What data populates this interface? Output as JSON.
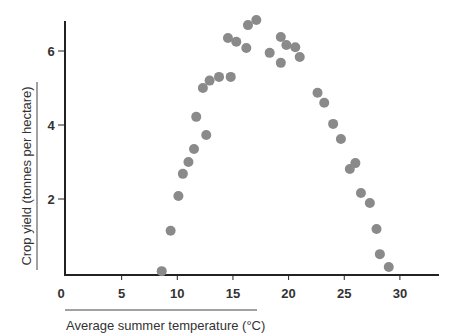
{
  "chart_data": {
    "type": "scatter",
    "title": "",
    "xlabel": "Average summer temperature (°C)",
    "ylabel": "Crop yield (tonnes per hectare)",
    "xlim": [
      0,
      33.5
    ],
    "ylim": [
      0,
      6.8
    ],
    "x_ticks": [
      0,
      5,
      10,
      15,
      20,
      25,
      30
    ],
    "y_ticks": [
      2,
      4,
      6
    ],
    "grid": false,
    "legend": null,
    "marker_color": "#8a8a8a",
    "series": [
      {
        "name": "Crop yield",
        "points": [
          {
            "x": 8.6,
            "y": 0.05
          },
          {
            "x": 9.4,
            "y": 1.14
          },
          {
            "x": 10.1,
            "y": 2.08
          },
          {
            "x": 10.5,
            "y": 2.68
          },
          {
            "x": 11.0,
            "y": 3.0
          },
          {
            "x": 11.5,
            "y": 3.35
          },
          {
            "x": 11.7,
            "y": 4.22
          },
          {
            "x": 12.3,
            "y": 5.0
          },
          {
            "x": 12.6,
            "y": 3.73
          },
          {
            "x": 12.9,
            "y": 5.2
          },
          {
            "x": 13.75,
            "y": 5.3
          },
          {
            "x": 14.55,
            "y": 6.35
          },
          {
            "x": 14.8,
            "y": 5.3
          },
          {
            "x": 15.3,
            "y": 6.25
          },
          {
            "x": 16.2,
            "y": 6.08
          },
          {
            "x": 16.35,
            "y": 6.7
          },
          {
            "x": 17.1,
            "y": 6.84
          },
          {
            "x": 18.3,
            "y": 5.95
          },
          {
            "x": 19.3,
            "y": 6.38
          },
          {
            "x": 19.3,
            "y": 5.68
          },
          {
            "x": 19.8,
            "y": 6.16
          },
          {
            "x": 20.6,
            "y": 6.1
          },
          {
            "x": 21.0,
            "y": 5.84
          },
          {
            "x": 22.6,
            "y": 4.87
          },
          {
            "x": 23.2,
            "y": 4.6
          },
          {
            "x": 24.0,
            "y": 4.03
          },
          {
            "x": 24.7,
            "y": 3.62
          },
          {
            "x": 25.5,
            "y": 2.81
          },
          {
            "x": 26.0,
            "y": 2.97
          },
          {
            "x": 26.5,
            "y": 2.16
          },
          {
            "x": 27.3,
            "y": 1.89
          },
          {
            "x": 27.9,
            "y": 1.19
          },
          {
            "x": 28.2,
            "y": 0.51
          },
          {
            "x": 29.0,
            "y": 0.16
          }
        ]
      }
    ]
  },
  "axes": {
    "x_title": "Average summer temperature (°C)",
    "y_title": "Crop yield (tonnes per hectare)"
  }
}
